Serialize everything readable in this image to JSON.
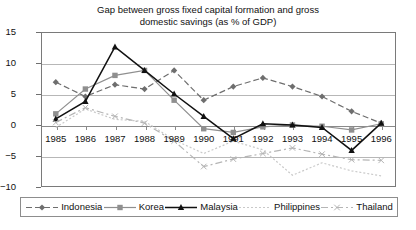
{
  "chart_data": {
    "type": "line",
    "title": "Gap between gross fixed capital formation and gross domestic savings (as % of GDP)",
    "title_line1": "Gap between gross fixed capital formation and gross",
    "title_line2": "domestic savings (as % of GDP)",
    "xlabel": "",
    "ylabel": "",
    "grid": true,
    "legend_position": "bottom",
    "ylim": [
      -10,
      15
    ],
    "yticks": [
      "15",
      "10",
      "5",
      "0",
      "−5",
      "−10"
    ],
    "ytick_values": [
      15,
      10,
      5,
      0,
      -5,
      -10
    ],
    "categories": [
      "1985",
      "1986",
      "1987",
      "1988",
      "1989",
      "1990",
      "1991",
      "1992",
      "1993",
      "1994",
      "1995",
      "1996"
    ],
    "series": [
      {
        "name": "Indonesia",
        "marker": "diamond",
        "color": "#6e6e6e",
        "dash": "6,3",
        "values": [
          6.9,
          4.6,
          6.5,
          5.8,
          8.8,
          4.0,
          6.2,
          7.6,
          6.2,
          4.6,
          2.2,
          0.3
        ]
      },
      {
        "name": "Korea",
        "marker": "square",
        "color": "#8f8f8f",
        "dash": "none",
        "values": [
          1.8,
          5.8,
          8.0,
          8.8,
          4.0,
          -0.6,
          -1.2,
          -0.3,
          0.0,
          -0.2,
          -0.8,
          0.2
        ]
      },
      {
        "name": "Malaysia",
        "marker": "triangle",
        "color": "#111111",
        "dash": "none",
        "values": [
          1.0,
          3.8,
          12.6,
          8.8,
          5.0,
          1.4,
          -2.2,
          0.2,
          0.0,
          -0.4,
          -4.1,
          0.3
        ]
      },
      {
        "name": "Philippines",
        "marker": "none",
        "color": "#c9c9c9",
        "dash": "2,2",
        "values": [
          -0.4,
          2.6,
          0.9,
          0.6,
          -2.4,
          -4.6,
          -2.6,
          -4.0,
          -8.1,
          -6.1,
          -7.4,
          -8.2
        ]
      },
      {
        "name": "Thailand",
        "marker": "x",
        "color": "#b5b5b5",
        "dash": "7,3,2,3",
        "values": [
          0.4,
          2.8,
          1.4,
          0.3,
          -2.6,
          -6.7,
          -5.5,
          -4.6,
          -3.7,
          -4.7,
          -5.6,
          -5.7
        ]
      }
    ]
  },
  "legend": {
    "items": [
      {
        "label": "Indonesia",
        "swatch": "line-diamond-swatch"
      },
      {
        "label": "Korea",
        "swatch": "line-square-swatch"
      },
      {
        "label": "Malaysia",
        "swatch": "line-triangle-swatch"
      },
      {
        "label": "Philippines",
        "swatch": "line-dotted-swatch"
      },
      {
        "label": "Thailand",
        "swatch": "line-dashx-swatch"
      }
    ]
  }
}
